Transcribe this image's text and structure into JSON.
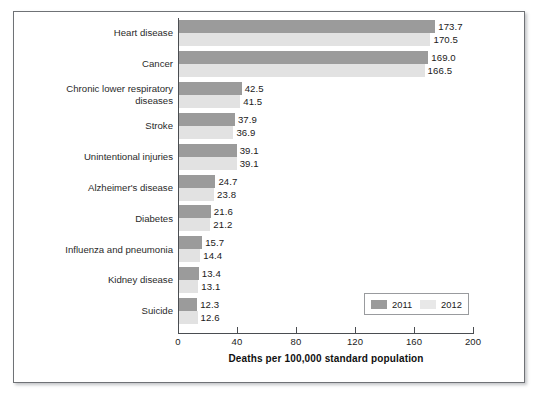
{
  "chart_data": {
    "type": "bar",
    "orientation": "horizontal",
    "title": "",
    "xlabel": "Deaths per 100,000 standard population",
    "ylabel": "",
    "xlim": [
      0,
      200
    ],
    "xticks": [
      0,
      40,
      80,
      120,
      160,
      200
    ],
    "xtick_labels": [
      "0",
      "40",
      "80",
      "120",
      "160",
      "200"
    ],
    "grid": false,
    "legend_position": "lower-right-inside",
    "categories": [
      "Heart disease",
      "Cancer",
      "Chronic lower respiratory diseases",
      "Stroke",
      "Unintentional injuries",
      "Alzheimer's disease",
      "Diabetes",
      "Influenza and pneumonia",
      "Kidney disease",
      "Suicide"
    ],
    "category_lines": [
      [
        "Heart disease"
      ],
      [
        "Cancer"
      ],
      [
        "Chronic lower respiratory",
        "diseases"
      ],
      [
        "Stroke"
      ],
      [
        "Unintentional injuries"
      ],
      [
        "Alzheimer's disease"
      ],
      [
        "Diabetes"
      ],
      [
        "Influenza and pneumonia"
      ],
      [
        "Kidney disease"
      ],
      [
        "Suicide"
      ]
    ],
    "series": [
      {
        "name": "2011",
        "color": "#9b9b9b",
        "values": [
          173.7,
          169.0,
          42.5,
          37.9,
          39.1,
          24.7,
          21.6,
          15.7,
          13.4,
          12.3
        ],
        "value_labels": [
          "173.7",
          "169.0",
          "42.5",
          "37.9",
          "39.1",
          "24.7",
          "21.6",
          "15.7",
          "13.4",
          "12.3"
        ]
      },
      {
        "name": "2012",
        "color": "#e2e2e2",
        "values": [
          170.5,
          166.5,
          41.5,
          36.9,
          39.1,
          23.8,
          21.2,
          14.4,
          13.1,
          12.6
        ],
        "value_labels": [
          "170.5",
          "166.5",
          "41.5",
          "36.9",
          "39.1",
          "23.8",
          "21.2",
          "14.4",
          "13.1",
          "12.6"
        ]
      }
    ],
    "legend": [
      {
        "label": "2011",
        "color": "#9b9b9b"
      },
      {
        "label": "2012",
        "color": "#e2e2e2"
      }
    ]
  }
}
